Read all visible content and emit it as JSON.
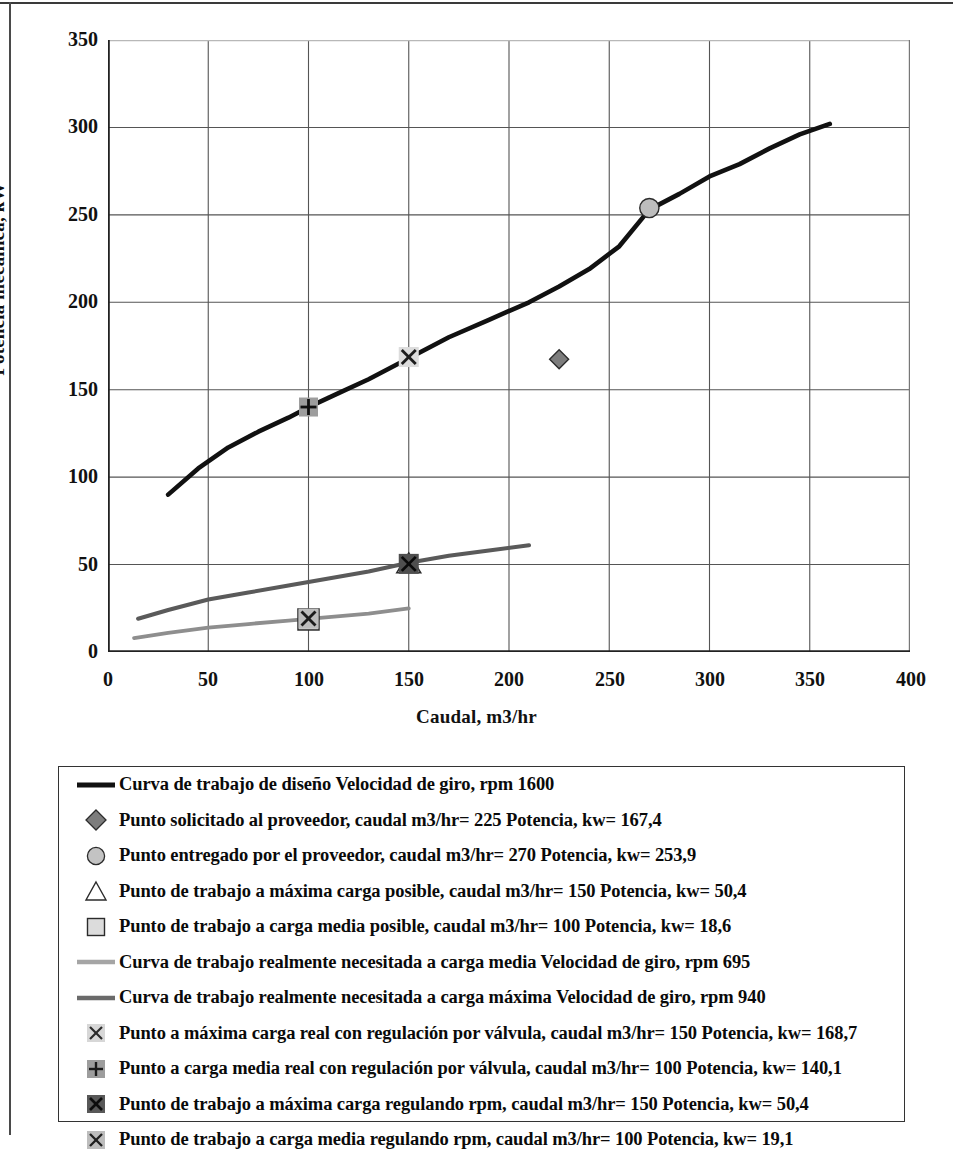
{
  "axes": {
    "ylabel": "Potencia mecánica, kW",
    "xlabel": "Caudal, m3/hr",
    "yticks": [
      "0",
      "50",
      "100",
      "150",
      "200",
      "250",
      "300",
      "350"
    ],
    "xticks": [
      "0",
      "50",
      "100",
      "150",
      "200",
      "250",
      "300",
      "350",
      "400"
    ]
  },
  "legend": {
    "items": [
      {
        "key": "thick-black-line",
        "label": "Curva de trabajo de diseño Velocidad de giro, rpm 1600"
      },
      {
        "key": "gray-diamond-marker",
        "label": "Punto solicitado al proveedor, caudal m3/hr= 225 Potencia, kw= 167,4"
      },
      {
        "key": "gray-circle-marker",
        "label": "Punto entregado por el proveedor, caudal m3/hr= 270 Potencia, kw= 253,9"
      },
      {
        "key": "open-triangle-marker",
        "label": "Punto de trabajo a máxima carga posible, caudal m3/hr= 150 Potencia, kw= 50,4"
      },
      {
        "key": "light-square-marker",
        "label": "Punto de trabajo a carga media posible, caudal m3/hr= 100 Potencia, kw= 18,6"
      },
      {
        "key": "light-gray-line",
        "label": "Curva de trabajo realmente necesitada a carga media Velocidad de giro, rpm 695"
      },
      {
        "key": "dark-gray-line",
        "label": "Curva de trabajo realmente necesitada a carga máxima Velocidad de giro, rpm 940"
      },
      {
        "key": "light-x-marker",
        "label": "Punto a máxima carga real con regulación por válvula, caudal m3/hr= 150 Potencia, kw= 168,7"
      },
      {
        "key": "plus-marker",
        "label": "Punto a carga media real con regulación por válvula, caudal m3/hr= 100 Potencia, kw= 140,1"
      },
      {
        "key": "dark-x-marker",
        "label": "Punto de trabajo a máxima carga regulando rpm, caudal m3/hr= 150 Potencia, kw= 50,4"
      },
      {
        "key": "mid-x-marker",
        "label": "Punto de trabajo a carga media regulando rpm, caudal m3/hr= 100 Potencia, kw= 19,1"
      }
    ]
  },
  "colors": {
    "design_curve": "#111111",
    "max_load_curve": "#5a5a5a",
    "medium_load_curve": "#8e8e8e",
    "grid": "#555555",
    "axis": "#222222",
    "marker_light": "#cfcfcf",
    "marker_mid": "#9a9a9a",
    "marker_dark": "#4a4a4a"
  },
  "chart_data": {
    "type": "line",
    "title": "",
    "xlabel": "Caudal, m3/hr",
    "ylabel": "Potencia mecánica, kW",
    "xlim": [
      0,
      400
    ],
    "ylim": [
      0,
      350
    ],
    "xticks": [
      0,
      50,
      100,
      150,
      200,
      250,
      300,
      350,
      400
    ],
    "yticks": [
      0,
      50,
      100,
      150,
      200,
      250,
      300,
      350
    ],
    "grid": true,
    "legend_position": "below-plot",
    "series": [
      {
        "name": "Curva de trabajo de diseño Velocidad de giro, rpm 1600",
        "color": "#111111",
        "width": 4.6,
        "x": [
          30,
          45,
          60,
          75,
          90,
          100,
          115,
          130,
          150,
          170,
          190,
          210,
          225,
          240,
          255,
          270,
          285,
          300,
          315,
          330,
          345,
          360
        ],
        "y": [
          90,
          105,
          117,
          126,
          134,
          140,
          148,
          156,
          168,
          180,
          190,
          200,
          209,
          219,
          232,
          253,
          262,
          272,
          279,
          288,
          296,
          302
        ]
      },
      {
        "name": "Curva de trabajo realmente necesitada a carga máxima Velocidad de giro, rpm 940",
        "color": "#5a5a5a",
        "width": 4.0,
        "x": [
          15,
          30,
          50,
          70,
          90,
          110,
          130,
          150,
          170,
          190,
          210
        ],
        "y": [
          19,
          24,
          30,
          34,
          38,
          42,
          46,
          51,
          55,
          58,
          61
        ]
      },
      {
        "name": "Curva de trabajo realmente necesitada a carga media Velocidad de giro, rpm 695",
        "color": "#8e8e8e",
        "width": 3.8,
        "x": [
          13,
          30,
          50,
          70,
          90,
          110,
          130,
          150
        ],
        "y": [
          8,
          11,
          14,
          16,
          18,
          20,
          22,
          25
        ]
      }
    ],
    "points": [
      {
        "name": "Punto solicitado al proveedor",
        "marker": "diamond",
        "x": 225,
        "y": 167.4
      },
      {
        "name": "Punto entregado por el proveedor",
        "marker": "circle",
        "x": 270,
        "y": 253.9
      },
      {
        "name": "Punto de trabajo a máxima carga posible",
        "marker": "triangle",
        "x": 150,
        "y": 50.4
      },
      {
        "name": "Punto de trabajo a carga media posible",
        "marker": "square",
        "x": 100,
        "y": 18.6
      },
      {
        "name": "Punto a máxima carga real con regulación por válvula",
        "marker": "x-light",
        "x": 150,
        "y": 168.7
      },
      {
        "name": "Punto a carga media real con regulación por válvula",
        "marker": "plus",
        "x": 100,
        "y": 140.1
      },
      {
        "name": "Punto de trabajo a máxima carga regulando rpm",
        "marker": "x-dark",
        "x": 150,
        "y": 50.4
      },
      {
        "name": "Punto de trabajo a carga media regulando rpm",
        "marker": "x-mid",
        "x": 100,
        "y": 19.1
      }
    ]
  }
}
